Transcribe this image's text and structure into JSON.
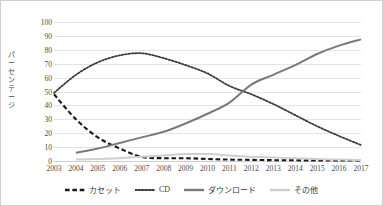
{
  "chart_data": {
    "type": "line",
    "title": "",
    "xlabel": "",
    "ylabel": "パーセンテージ",
    "ylim": [
      0,
      100
    ],
    "ytick_step": 10,
    "grid": true,
    "legend_position": "bottom",
    "categories": [
      "2003",
      "2004",
      "2005",
      "2006",
      "2007",
      "2008",
      "2009",
      "2010",
      "2011",
      "2012",
      "2013",
      "2014",
      "2015",
      "2016",
      "2017"
    ],
    "series": [
      {
        "name": "カセット",
        "color": "#1a1a1a",
        "style": "dashed",
        "values": [
          48,
          30,
          17,
          9,
          3,
          2,
          2,
          1.5,
          1,
          0.8,
          0.6,
          0.5,
          0.4,
          0.4,
          0.3
        ]
      },
      {
        "name": "CD",
        "color": "#3b3b3b",
        "style": "dotted",
        "values": [
          49,
          62,
          71,
          76,
          77.5,
          74,
          69,
          63,
          54,
          48,
          41,
          33,
          25,
          18,
          11.5
        ]
      },
      {
        "name": "ダウンロード",
        "color": "#7a7a7a",
        "style": "solid",
        "values": [
          null,
          6,
          9,
          13,
          17,
          21,
          27,
          34,
          42,
          55,
          62,
          69,
          77,
          83,
          87.5
        ]
      },
      {
        "name": "その他",
        "color": "#cfcfcf",
        "style": "solid",
        "values": [
          null,
          1,
          1.5,
          2,
          3,
          4,
          5,
          5,
          4,
          3,
          2.5,
          2,
          1.5,
          1,
          0.8
        ]
      }
    ],
    "ytick_labels": [
      "0",
      "10",
      "20",
      "30",
      "40",
      "50",
      "60",
      "70",
      "80",
      "90",
      "100"
    ]
  },
  "legend": {
    "items": [
      {
        "label": "カセット"
      },
      {
        "label": "CD"
      },
      {
        "label": "ダウンロード"
      },
      {
        "label": "その他"
      }
    ]
  }
}
